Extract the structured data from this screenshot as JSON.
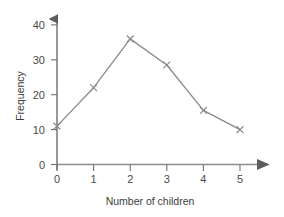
{
  "chart_data": {
    "type": "line",
    "title": "",
    "subtitle": "",
    "xlabel": "Number of children",
    "ylabel": "Frequency",
    "x": [
      0,
      1,
      2,
      3,
      4,
      5
    ],
    "values": [
      11,
      22,
      36,
      28.5,
      15.5,
      10
    ],
    "series": [
      {
        "name": "Frequency",
        "values": [
          11,
          22,
          36,
          28.5,
          15.5,
          10
        ]
      }
    ],
    "xticklabels": [
      "0",
      "1",
      "2",
      "3",
      "4",
      "5"
    ],
    "yticklabels": [
      "0",
      "10",
      "20",
      "30",
      "40"
    ],
    "yticks": [
      0,
      10,
      20,
      30,
      40
    ],
    "xlim": [
      0,
      5
    ],
    "ylim": [
      0,
      40
    ],
    "grid": false,
    "legend": false,
    "legend_position": "none",
    "marker": "x",
    "line_color": "#8a8a8a",
    "marker_color": "#8a8a8a",
    "axis_color": "#6e6e6e",
    "text_color": "#3c3c3c",
    "background_color": "#ffffff",
    "annotations": []
  },
  "axes": {
    "x_arrow": "arrow-right",
    "y_arrow": "arrow-up"
  }
}
